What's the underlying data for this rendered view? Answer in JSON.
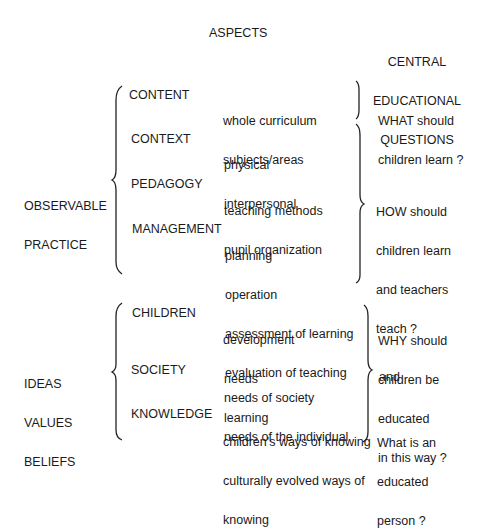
{
  "headers": {
    "aspects": "ASPECTS",
    "questions": [
      "CENTRAL",
      "EDUCATIONAL",
      "QUESTIONS"
    ]
  },
  "groups": [
    {
      "label": [
        "OBSERVABLE",
        "PRACTICE"
      ],
      "aspects": [
        {
          "name": "CONTENT",
          "items": [
            "whole curriculum",
            "subjects/areas"
          ]
        },
        {
          "name": "CONTEXT",
          "items": [
            "physical",
            "interpersonal"
          ]
        },
        {
          "name": "PEDAGOGY",
          "items": [
            "teaching methods",
            "pupil organization"
          ]
        },
        {
          "name": "MANAGEMENT",
          "items": [
            "planning",
            "operation",
            "assessment of learning",
            "evaluation of teaching"
          ]
        }
      ],
      "questions": [
        [
          "WHAT should",
          "children learn ?"
        ],
        [
          "HOW should",
          "children learn",
          "and teachers",
          "teach ?"
        ]
      ]
    },
    {
      "label": [
        "IDEAS",
        "VALUES",
        "BELIEFS"
      ],
      "aspects": [
        {
          "name": "CHILDREN",
          "items": [
            "development",
            "needs",
            "learning"
          ]
        },
        {
          "name": "SOCIETY",
          "items": [
            "needs of society",
            "needs of the individual"
          ]
        },
        {
          "name": "KNOWLEDGE",
          "items": [
            "children's ways of knowing",
            "culturally evolved ways of",
            "knowing"
          ]
        }
      ],
      "questions": [
        [
          "WHY should",
          "children be",
          "educated",
          "in this way ?"
        ],
        [
          "and"
        ],
        [
          "What is an",
          "educated",
          "person ?"
        ]
      ]
    }
  ]
}
